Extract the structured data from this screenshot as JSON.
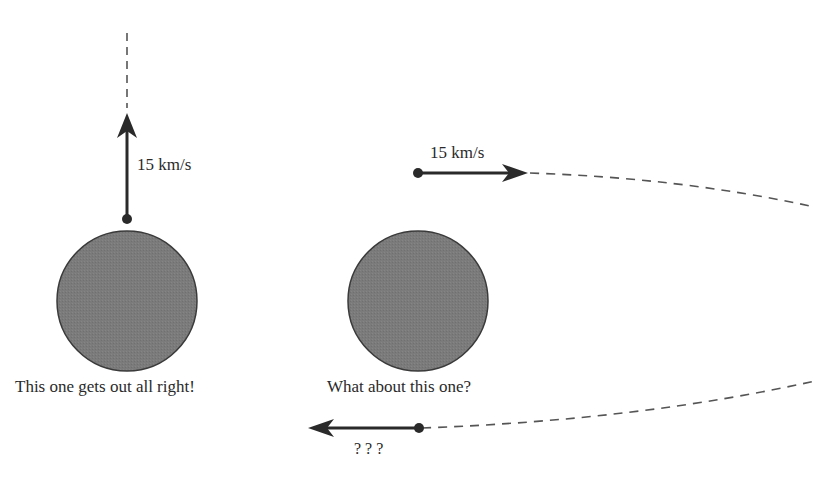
{
  "diagram": {
    "colors": {
      "planet_fill": "#7a7a7a",
      "planet_stroke": "#3a3a3a",
      "arrow": "#2a2a2a",
      "dashed": "#555555",
      "text": "#2a2a2a"
    },
    "left_scene": {
      "velocity_label": "15 km/s",
      "caption": "This one gets out all right!"
    },
    "right_scene": {
      "velocity_label": "15 km/s",
      "caption": "What about this one?",
      "return_label": "? ? ?"
    }
  }
}
